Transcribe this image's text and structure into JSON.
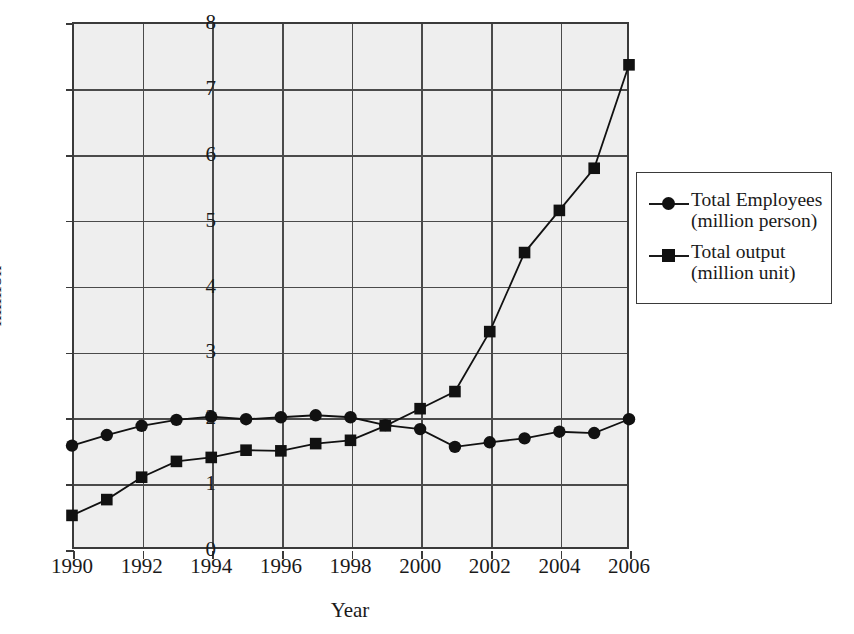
{
  "chart_data": {
    "type": "line",
    "title": "",
    "xlabel": "Year",
    "ylabel": "million",
    "xlim": [
      1990,
      2006
    ],
    "ylim": [
      0,
      8
    ],
    "grid": true,
    "legend_position": "right",
    "x": [
      1990,
      1991,
      1992,
      1993,
      1994,
      1995,
      1996,
      1997,
      1998,
      1999,
      2000,
      2001,
      2002,
      2003,
      2004,
      2005,
      2006
    ],
    "x_tick_labels": [
      "1990",
      "1992",
      "1994",
      "1996",
      "1998",
      "2000",
      "2002",
      "2004",
      "2006"
    ],
    "x_ticks": [
      1990,
      1992,
      1994,
      1996,
      1998,
      2000,
      2002,
      2004,
      2006
    ],
    "y_tick_labels": [
      "0",
      "1",
      "2",
      "3",
      "4",
      "5",
      "6",
      "7",
      "8"
    ],
    "y_ticks": [
      0,
      1,
      2,
      3,
      4,
      5,
      6,
      7,
      8
    ],
    "series": [
      {
        "name": "Total Employees\n(million person)",
        "marker": "circle",
        "color": "#111111",
        "values": [
          1.57,
          1.73,
          1.87,
          1.96,
          2.01,
          1.97,
          2.0,
          2.03,
          2.0,
          1.88,
          1.82,
          1.55,
          1.62,
          1.68,
          1.78,
          1.76,
          1.97
        ]
      },
      {
        "name": "Total output\n(million unit)",
        "marker": "square",
        "color": "#111111",
        "values": [
          0.51,
          0.75,
          1.09,
          1.33,
          1.39,
          1.5,
          1.49,
          1.6,
          1.65,
          1.87,
          2.13,
          2.39,
          3.3,
          4.5,
          5.14,
          5.78,
          7.35
        ]
      }
    ]
  },
  "legend": {
    "entries": [
      {
        "label": "Total Employees\n(million person)",
        "marker": "circle-marker"
      },
      {
        "label": "Total output\n(million unit)",
        "marker": "square-marker"
      }
    ]
  },
  "axes": {
    "x_title": "Year",
    "y_title": "million"
  },
  "colors": {
    "plot_background": "#eeeeee",
    "grid": "#4a4a4a",
    "frame": "#3a3a3a",
    "series": "#111111",
    "text": "#1a1a1a"
  }
}
